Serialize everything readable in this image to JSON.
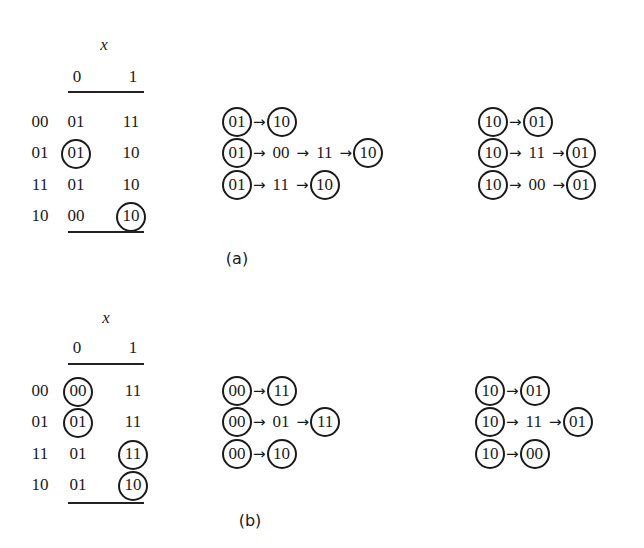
{
  "panels": [
    {
      "caption": "(a)",
      "table": {
        "input_label": "x",
        "columns": [
          "0",
          "1"
        ],
        "rows": [
          {
            "state": "00",
            "cells": [
              {
                "v": "01",
                "c": false
              },
              {
                "v": "11",
                "c": false
              }
            ]
          },
          {
            "state": "01",
            "cells": [
              {
                "v": "01",
                "c": true
              },
              {
                "v": "10",
                "c": false
              }
            ]
          },
          {
            "state": "11",
            "cells": [
              {
                "v": "01",
                "c": false
              },
              {
                "v": "10",
                "c": false
              }
            ]
          },
          {
            "state": "10",
            "cells": [
              {
                "v": "00",
                "c": false
              },
              {
                "v": "10",
                "c": true
              }
            ]
          }
        ]
      },
      "chains_left": [
        [
          {
            "v": "01",
            "c": true
          },
          {
            "v": "10",
            "c": true
          }
        ],
        [
          {
            "v": "01",
            "c": true
          },
          {
            "v": "00",
            "c": false
          },
          {
            "v": "11",
            "c": false
          },
          {
            "v": "10",
            "c": true
          }
        ],
        [
          {
            "v": "01",
            "c": true
          },
          {
            "v": "11",
            "c": false
          },
          {
            "v": "10",
            "c": true
          }
        ]
      ],
      "chains_right": [
        [
          {
            "v": "10",
            "c": true
          },
          {
            "v": "01",
            "c": true
          }
        ],
        [
          {
            "v": "10",
            "c": true
          },
          {
            "v": "11",
            "c": false
          },
          {
            "v": "01",
            "c": true
          }
        ],
        [
          {
            "v": "10",
            "c": true
          },
          {
            "v": "00",
            "c": false
          },
          {
            "v": "01",
            "c": true
          }
        ]
      ]
    },
    {
      "caption": "(b)",
      "table": {
        "input_label": "x",
        "columns": [
          "0",
          "1"
        ],
        "rows": [
          {
            "state": "00",
            "cells": [
              {
                "v": "00",
                "c": true
              },
              {
                "v": "11",
                "c": false
              }
            ]
          },
          {
            "state": "01",
            "cells": [
              {
                "v": "01",
                "c": true
              },
              {
                "v": "11",
                "c": false
              }
            ]
          },
          {
            "state": "11",
            "cells": [
              {
                "v": "01",
                "c": false
              },
              {
                "v": "11",
                "c": true
              }
            ]
          },
          {
            "state": "10",
            "cells": [
              {
                "v": "01",
                "c": false
              },
              {
                "v": "10",
                "c": true
              }
            ]
          }
        ]
      },
      "chains_left": [
        [
          {
            "v": "00",
            "c": true
          },
          {
            "v": "11",
            "c": true
          }
        ],
        [
          {
            "v": "00",
            "c": true
          },
          {
            "v": "01",
            "c": false
          },
          {
            "v": "11",
            "c": true
          }
        ],
        [
          {
            "v": "00",
            "c": true
          },
          {
            "v": "10",
            "c": true
          }
        ]
      ],
      "chains_right": [
        [
          {
            "v": "10",
            "c": true
          },
          {
            "v": "01",
            "c": true
          }
        ],
        [
          {
            "v": "10",
            "c": true
          },
          {
            "v": "11",
            "c": false
          },
          {
            "v": "01",
            "c": true
          }
        ],
        [
          {
            "v": "10",
            "c": true
          },
          {
            "v": "00",
            "c": true
          }
        ]
      ]
    }
  ],
  "arrow_glyph": "→"
}
